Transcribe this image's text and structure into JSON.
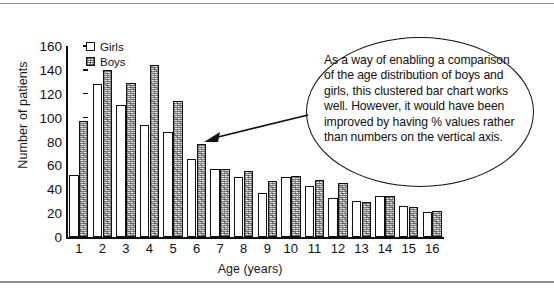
{
  "chart_data": {
    "type": "bar",
    "title": "",
    "xlabel": "Age (years)",
    "ylabel": "Number of patients",
    "categories": [
      "1",
      "2",
      "3",
      "4",
      "5",
      "6",
      "7",
      "8",
      "9",
      "10",
      "11",
      "12",
      "13",
      "14",
      "15",
      "16"
    ],
    "series": [
      {
        "name": "Girls",
        "values": [
          52,
          128,
          111,
          94,
          88,
          65,
          57,
          50,
          37,
          50,
          43,
          33,
          30,
          34,
          26,
          21
        ]
      },
      {
        "name": "Boys",
        "values": [
          97,
          140,
          129,
          144,
          114,
          78,
          57,
          55,
          47,
          51,
          48,
          45,
          29,
          34,
          25,
          22
        ]
      }
    ],
    "ylim": [
      0,
      160
    ],
    "yticks": [
      0,
      20,
      40,
      60,
      80,
      100,
      120,
      140,
      160
    ],
    "grid": false,
    "legend_position": "top-left"
  },
  "legend": {
    "items": [
      {
        "label": "Girls",
        "style": "open"
      },
      {
        "label": "Boys",
        "style": "textured"
      }
    ]
  },
  "callout": {
    "text": "As a way of enabling a comparison of the age distribution of boys and girls, this clustered bar chart works well. However, it would have been improved by having % values rather than numbers on the vertical axis."
  },
  "colors": {
    "ink": "#111111",
    "frame": "#8d8d8d",
    "girls_fill": "#ffffff",
    "boys_fill": "#e8e8e8"
  }
}
